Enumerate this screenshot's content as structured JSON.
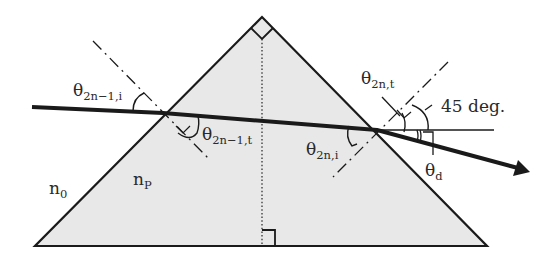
{
  "figure": {
    "colors": {
      "prism_fill": "#e8e8e8",
      "stroke": "#1a1a1a",
      "text": "#2a2a2a",
      "background": "#ffffff"
    }
  },
  "labels": {
    "theta_in_left": {
      "symbol": "θ",
      "sub": "2n−1,i"
    },
    "theta_t_left": {
      "symbol": "θ",
      "sub": "2n−1,t"
    },
    "theta_in_right": {
      "symbol": "θ",
      "sub": "2n,i"
    },
    "theta_t_right": {
      "symbol": "θ",
      "sub": "2n,t"
    },
    "angle_45": "45 deg.",
    "theta_d": {
      "symbol": "θ",
      "sub": "d"
    },
    "n_outside": {
      "symbol": "n",
      "sub": "0"
    },
    "n_prism": {
      "symbol": "n",
      "sub": "P"
    }
  },
  "geometry": {
    "prism": {
      "apex": [
        262,
        17
      ],
      "bottom_left": [
        35,
        246
      ],
      "bottom_right": [
        487,
        246
      ]
    },
    "ray": {
      "start": [
        32,
        107
      ],
      "entry": [
        163,
        113
      ],
      "exit": [
        377,
        130
      ],
      "end": [
        528,
        172
      ]
    }
  }
}
